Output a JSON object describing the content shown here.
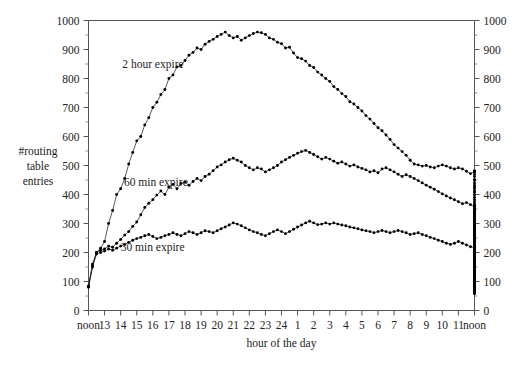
{
  "figure": {
    "width": 515,
    "height": 372,
    "background": "#ffffff",
    "ink_color": "#111111",
    "axis_color": "#555555"
  },
  "chart_data": {
    "type": "line",
    "title": "",
    "subtitle": "",
    "xlabel": "hour of the day",
    "ylabel": "#routing table entries",
    "ylabel_lines": [
      "#routing",
      "table",
      "entries"
    ],
    "grid": false,
    "legend": "inline-annotations",
    "xlim": [
      0,
      24
    ],
    "ylim": [
      0,
      1000
    ],
    "y_tick_step": 100,
    "y_minor_ticks": true,
    "dual_y_axis": true,
    "markers": "filled-circle",
    "x_tick_labels": [
      "noon",
      "13",
      "14",
      "15",
      "16",
      "17",
      "18",
      "19",
      "20",
      "21",
      "22",
      "23",
      "24",
      "1",
      "2",
      "3",
      "4",
      "5",
      "6",
      "7",
      "8",
      "9",
      "10",
      "11",
      "noon"
    ],
    "y_tick_labels": [
      "0",
      "100",
      "200",
      "300",
      "400",
      "500",
      "600",
      "700",
      "800",
      "900",
      "1000"
    ],
    "y_tick_values": [
      0,
      100,
      200,
      300,
      400,
      500,
      600,
      700,
      800,
      900,
      1000
    ],
    "samples_per_hour": 4,
    "series": [
      {
        "name": "2 hour expire",
        "label": "2 hour expire",
        "label_x_hour": 2.1,
        "label_y_value": 835,
        "values": [
          85,
          160,
          200,
          215,
          238,
          300,
          345,
          400,
          420,
          455,
          505,
          545,
          585,
          600,
          640,
          665,
          700,
          718,
          745,
          762,
          800,
          812,
          840,
          845,
          862,
          880,
          890,
          905,
          900,
          918,
          928,
          935,
          945,
          952,
          960,
          948,
          940,
          945,
          932,
          940,
          948,
          955,
          960,
          958,
          952,
          940,
          935,
          925,
          920,
          905,
          908,
          888,
          872,
          868,
          860,
          845,
          838,
          822,
          812,
          800,
          790,
          772,
          762,
          748,
          738,
          720,
          712,
          700,
          688,
          672,
          660,
          645,
          630,
          620,
          605,
          590,
          572,
          560,
          548,
          535,
          518,
          505,
          502,
          498,
          500,
          495,
          492,
          498,
          502,
          498,
          492,
          488,
          492,
          488,
          480,
          472,
          478,
          482,
          478,
          470,
          462,
          452,
          448,
          440,
          432,
          425,
          420,
          412,
          408,
          400,
          398,
          390,
          382,
          375,
          368,
          362,
          352,
          348,
          340,
          335,
          328,
          322,
          315,
          308,
          300,
          295,
          288,
          282,
          278,
          272,
          268,
          265,
          262,
          268,
          272,
          278,
          272,
          265,
          262,
          258,
          262,
          268,
          272,
          278,
          272,
          268,
          262,
          258,
          255,
          250,
          248,
          245,
          240,
          238,
          242,
          248,
          258,
          268,
          278,
          272,
          265,
          258,
          252,
          248,
          242,
          238,
          232,
          228,
          222,
          218,
          215,
          212,
          208,
          205,
          200,
          198,
          195,
          192,
          190,
          188,
          192,
          198,
          192,
          188,
          185,
          182,
          178,
          175,
          172,
          170,
          168,
          165,
          162,
          160,
          158,
          155,
          152,
          150,
          148,
          145,
          142,
          140,
          138,
          135,
          132,
          130,
          128,
          125,
          122,
          120,
          118,
          115,
          112,
          110,
          108,
          110,
          112,
          115,
          118,
          122,
          125,
          128,
          132,
          135,
          138,
          142,
          148,
          152,
          158,
          162,
          168,
          172,
          178,
          182,
          188,
          192,
          198,
          205,
          212,
          220,
          228,
          238,
          248,
          258,
          270,
          282,
          292,
          302,
          312,
          322,
          332,
          340,
          345,
          350
        ]
      },
      {
        "name": "60 min expire",
        "label": "60 min expire",
        "label_x_hour": 2.2,
        "label_y_value": 430,
        "values": [
          82,
          155,
          200,
          208,
          212,
          222,
          218,
          232,
          245,
          260,
          272,
          290,
          305,
          330,
          355,
          370,
          382,
          398,
          412,
          400,
          425,
          435,
          420,
          438,
          442,
          432,
          445,
          455,
          448,
          462,
          470,
          482,
          495,
          502,
          512,
          520,
          525,
          518,
          512,
          500,
          492,
          485,
          492,
          488,
          478,
          485,
          492,
          500,
          512,
          520,
          528,
          535,
          542,
          548,
          552,
          545,
          538,
          530,
          522,
          528,
          522,
          515,
          508,
          512,
          505,
          498,
          502,
          495,
          490,
          485,
          478,
          482,
          475,
          488,
          492,
          485,
          478,
          470,
          462,
          468,
          462,
          455,
          448,
          440,
          432,
          425,
          418,
          410,
          402,
          395,
          388,
          382,
          375,
          368,
          372,
          365,
          358,
          362,
          355,
          348,
          342,
          335,
          330,
          325,
          318,
          312,
          308,
          302,
          296,
          290,
          285,
          280,
          276,
          272,
          268,
          262,
          258,
          262,
          258,
          252,
          248,
          252,
          258,
          262,
          268,
          262,
          258,
          252,
          258,
          262,
          268,
          272,
          268,
          262,
          258,
          262,
          268,
          262,
          258,
          252,
          248,
          252,
          258,
          268,
          275,
          268,
          262,
          255,
          248,
          242,
          238,
          232,
          228,
          232,
          238,
          245,
          252,
          248,
          242,
          235,
          228,
          222,
          218,
          212,
          208,
          202,
          198,
          195,
          190,
          186,
          182,
          178,
          175,
          172,
          168,
          165,
          162,
          158,
          155,
          158,
          162,
          158,
          155,
          152,
          148,
          145,
          142,
          140,
          138,
          135,
          132,
          130,
          128,
          132,
          138,
          142,
          138,
          135,
          132,
          130,
          128,
          126,
          124,
          128,
          132,
          138,
          142,
          146,
          150,
          148,
          145,
          142,
          140,
          142,
          145,
          148,
          152,
          155,
          158,
          162,
          165,
          168,
          170,
          172,
          175,
          172,
          170,
          168,
          172,
          176,
          180,
          184,
          188,
          182,
          178,
          174,
          178,
          182,
          186,
          190,
          188,
          186,
          190,
          192,
          195,
          192,
          190,
          194,
          196
        ]
      },
      {
        "name": "30 min expire",
        "label": "30 min expire",
        "label_x_hour": 2.0,
        "label_y_value": 205,
        "values": [
          80,
          150,
          195,
          200,
          205,
          212,
          208,
          215,
          222,
          228,
          235,
          242,
          248,
          252,
          258,
          262,
          255,
          248,
          252,
          258,
          262,
          268,
          262,
          258,
          265,
          272,
          268,
          262,
          268,
          275,
          272,
          268,
          275,
          282,
          288,
          295,
          302,
          298,
          292,
          285,
          278,
          272,
          268,
          262,
          258,
          265,
          272,
          278,
          272,
          265,
          272,
          280,
          288,
          295,
          302,
          308,
          302,
          296,
          298,
          302,
          298,
          302,
          298,
          295,
          292,
          288,
          285,
          282,
          278,
          275,
          272,
          268,
          272,
          276,
          272,
          268,
          272,
          276,
          272,
          268,
          262,
          265,
          268,
          262,
          258,
          252,
          248,
          242,
          238,
          232,
          228,
          232,
          238,
          232,
          226,
          220,
          215,
          208,
          202,
          196,
          200,
          205,
          202,
          198,
          195,
          192,
          188,
          185,
          188,
          192,
          188,
          185,
          182,
          178,
          175,
          172,
          168,
          165,
          162,
          165,
          168,
          172,
          168,
          165,
          162,
          158,
          155,
          158,
          162,
          158,
          155,
          158,
          162,
          165,
          162,
          158,
          155,
          158,
          162,
          158,
          155,
          152,
          155,
          158,
          162,
          165,
          162,
          158,
          155,
          152,
          148,
          145,
          148,
          152,
          156,
          162,
          168,
          162,
          156,
          150,
          145,
          142,
          138,
          135,
          132,
          128,
          125,
          122,
          125,
          128,
          132,
          135,
          132,
          128,
          125,
          122,
          118,
          115,
          112,
          108,
          105,
          102,
          100,
          98,
          95,
          98,
          102,
          105,
          102,
          98,
          95,
          92,
          95,
          98,
          95,
          92,
          90,
          88,
          86,
          88,
          90,
          88,
          86,
          84,
          82,
          80,
          78,
          76,
          78,
          82,
          86,
          84,
          80,
          76,
          72,
          68,
          65,
          62,
          58,
          62,
          70,
          78,
          85,
          90,
          88,
          85,
          88,
          92,
          96,
          100,
          98,
          96,
          100,
          104,
          102,
          100,
          98,
          102,
          106,
          104,
          102,
          100,
          104,
          106,
          108,
          106,
          104,
          108,
          110
        ]
      }
    ]
  }
}
